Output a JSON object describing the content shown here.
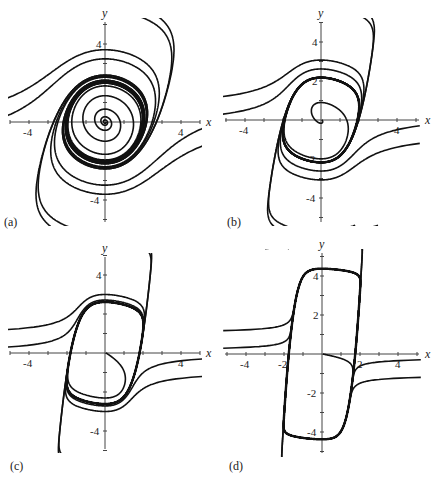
{
  "figure": {
    "panels": [
      {
        "id": "a",
        "label": "(a)",
        "mu": 0.3
      },
      {
        "id": "b",
        "label": "(b)",
        "mu": 1.0
      },
      {
        "id": "c",
        "label": "(c)",
        "mu": 2.0
      },
      {
        "id": "d",
        "label": "(d)",
        "mu": 5.0
      }
    ]
  },
  "chart_data": [
    {
      "type": "line",
      "title": "(a)",
      "subtype": "phase-portrait",
      "xlabel": "x",
      "ylabel": "y",
      "xlim": [
        -5,
        5
      ],
      "ylim": [
        -5,
        5
      ],
      "xticks": [
        -4,
        4
      ],
      "yticks": [
        4,
        -4
      ],
      "x_tick_labels": [
        "-4",
        "4"
      ],
      "y_tick_labels": [
        "4",
        "-4"
      ],
      "minor_ticks_step": 1,
      "grid": false,
      "description": "Trajectories spiral outward from an unstable focus at origin toward a near-circular limit cycle (radius ~2); outer trajectories approach it from outside.",
      "limit_cycle_extent": {
        "x": [
          -2.1,
          2.1
        ],
        "y": [
          -2.3,
          2.3
        ]
      },
      "equilibrium": [
        0,
        0
      ]
    },
    {
      "type": "line",
      "title": "(b)",
      "subtype": "phase-portrait",
      "xlabel": "x",
      "ylabel": "y",
      "xlim": [
        -5,
        5
      ],
      "ylim": [
        -5,
        5
      ],
      "xticks": [
        -4,
        4
      ],
      "yticks": [
        4,
        2,
        -2,
        -4
      ],
      "x_tick_labels": [
        "-4",
        "4"
      ],
      "y_tick_labels": [
        "4",
        "2",
        "-2",
        "-4"
      ],
      "minor_ticks_step": 1,
      "grid": false,
      "description": "Limit cycle becomes skewed (parallelogram-like); spiral from origin converges to it.",
      "limit_cycle_extent": {
        "x": [
          -2.0,
          2.0
        ],
        "y": [
          -2.7,
          2.7
        ]
      },
      "equilibrium": [
        0,
        0
      ]
    },
    {
      "type": "line",
      "title": "(c)",
      "subtype": "phase-portrait",
      "xlabel": "x",
      "ylabel": "y",
      "xlim": [
        -5,
        5
      ],
      "ylim": [
        -5,
        5
      ],
      "xticks": [
        -4,
        4
      ],
      "yticks": [
        4,
        -4
      ],
      "x_tick_labels": [
        "-4",
        "4"
      ],
      "y_tick_labels": [
        "4",
        "-4"
      ],
      "minor_ticks_step": 1,
      "grid": false,
      "description": "Limit cycle strongly distorted, S-shaped inner trajectories; relaxation behaviour emerging.",
      "limit_cycle_extent": {
        "x": [
          -2.0,
          2.0
        ],
        "y": [
          -3.3,
          3.3
        ]
      },
      "equilibrium": [
        0,
        0
      ]
    },
    {
      "type": "line",
      "title": "(d)",
      "subtype": "phase-portrait",
      "xlabel": "x",
      "ylabel": "y",
      "xlim": [
        -5,
        5
      ],
      "ylim": [
        -5,
        5
      ],
      "xticks": [
        -4,
        -2,
        2,
        4
      ],
      "yticks": [
        4,
        2,
        -2,
        -4
      ],
      "x_tick_labels": [
        "-4",
        "-2",
        "2",
        "4"
      ],
      "y_tick_labels": [
        "4",
        "2",
        "-2",
        "-4"
      ],
      "minor_ticks_step": 1,
      "grid": false,
      "description": "Relaxation oscillation: limit cycle with fast vertical jumps near x=±2 and slow segments; outer trajectories reach |y|>5.",
      "limit_cycle_extent": {
        "x": [
          -2.0,
          2.0
        ],
        "y": [
          -1.7,
          1.7
        ]
      },
      "equilibrium": [
        0,
        0
      ]
    }
  ]
}
